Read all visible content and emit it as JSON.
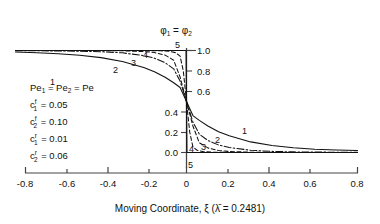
{
  "chart_data": {
    "type": "line",
    "title": "",
    "xlabel": "Moving Coordinate, ξ (λ̄ = 0.2481)",
    "ylabel": "φ₁ = φ₂",
    "xlim": [
      -0.8,
      0.8
    ],
    "ylim": [
      0.0,
      1.0
    ],
    "grid": false,
    "x_ticks": [
      "-0.8",
      "-0.6",
      "-0.4",
      "-0.2",
      "0",
      "0.2",
      "0.4",
      "0.6",
      "0.8"
    ],
    "x_tick_values": [
      -0.8,
      -0.6,
      -0.4,
      -0.2,
      0,
      0.2,
      0.4,
      0.6,
      0.8
    ],
    "y_ticks": [
      "1.0",
      "0.8",
      "0.6",
      "0.4",
      "0.2",
      "0.0"
    ],
    "y_tick_values": [
      1.0,
      0.8,
      0.6,
      0.4,
      0.2,
      0.0
    ],
    "legend_position": "inline-curve-labels",
    "series": [
      {
        "name": "1",
        "label": "1",
        "Pe": 20,
        "delta99": 2.294,
        "style": "solid",
        "x": [
          -0.8,
          -0.7,
          -0.6,
          -0.5,
          -0.4,
          -0.3,
          -0.2,
          -0.15,
          -0.1,
          -0.06,
          -0.03,
          0.0,
          0.03,
          0.06,
          0.1,
          0.15,
          0.2,
          0.3,
          0.4,
          0.5,
          0.6,
          0.7,
          0.8
        ],
        "y": [
          0.985,
          0.978,
          0.968,
          0.953,
          0.93,
          0.893,
          0.834,
          0.792,
          0.738,
          0.684,
          0.637,
          0.5,
          0.362,
          0.315,
          0.26,
          0.204,
          0.164,
          0.104,
          0.068,
          0.046,
          0.032,
          0.024,
          0.02
        ]
      },
      {
        "name": "2",
        "label": "2",
        "Pe": 40,
        "delta99": 1.147,
        "style": "dash-dot",
        "x": [
          -0.8,
          -0.7,
          -0.6,
          -0.5,
          -0.4,
          -0.3,
          -0.2,
          -0.15,
          -0.1,
          -0.06,
          -0.03,
          0.0,
          0.03,
          0.06,
          0.1,
          0.15,
          0.2,
          0.3,
          0.4,
          0.5,
          0.6,
          0.7,
          0.8
        ],
        "y": [
          0.998,
          0.997,
          0.996,
          0.993,
          0.988,
          0.977,
          0.95,
          0.925,
          0.88,
          0.82,
          0.7,
          0.5,
          0.3,
          0.18,
          0.118,
          0.074,
          0.049,
          0.022,
          0.011,
          0.006,
          0.004,
          0.003,
          0.002
        ]
      },
      {
        "name": "3",
        "label": "3",
        "Pe": 80,
        "delta99": 0.574,
        "style": "dashed",
        "x": [
          -0.8,
          -0.6,
          -0.4,
          -0.3,
          -0.2,
          -0.15,
          -0.1,
          -0.06,
          -0.03,
          0.0,
          0.03,
          0.06,
          0.1,
          0.15,
          0.2,
          0.3,
          0.4,
          0.6,
          0.8
        ],
        "y": [
          1.0,
          1.0,
          0.999,
          0.997,
          0.99,
          0.98,
          0.955,
          0.905,
          0.74,
          0.5,
          0.26,
          0.095,
          0.045,
          0.02,
          0.01,
          0.003,
          0.001,
          0.0,
          0.0
        ]
      },
      {
        "name": "4",
        "label": "4",
        "Pe": 160,
        "delta99": 0.287,
        "style": "dashed",
        "x": [
          -0.8,
          -0.4,
          -0.2,
          -0.12,
          -0.08,
          -0.05,
          -0.03,
          -0.015,
          0.0,
          0.015,
          0.03,
          0.05,
          0.08,
          0.12,
          0.2,
          0.4,
          0.8
        ],
        "y": [
          1.0,
          1.0,
          0.999,
          0.997,
          0.992,
          0.978,
          0.945,
          0.8,
          0.5,
          0.2,
          0.055,
          0.022,
          0.008,
          0.003,
          0.001,
          0.0,
          0.0
        ]
      },
      {
        "name": "5",
        "label": "5",
        "Pe": "∞",
        "delta99": 0,
        "style": "solid-step",
        "x": [
          -0.8,
          -0.002,
          0.0,
          0.002,
          0.8
        ],
        "y": [
          1.0,
          1.0,
          0.5,
          0.0,
          0.0
        ]
      }
    ]
  },
  "y_axis_label": "φ₁ = φ₂",
  "x_axis_label_parts": {
    "main": "Moving Coordinate, ξ (",
    "lambda": "λ",
    "rest": " = 0.2481)"
  },
  "legend_block": {
    "lines": [
      {
        "base": "Pe",
        "sub": "1",
        "mid": " = Pe",
        "sub2": "2",
        "tail": " = Pe",
        "sup": "",
        "value": ""
      },
      {
        "base": "c",
        "sub": "1",
        "sup": "f",
        "value": " = 0.05"
      },
      {
        "base": "c",
        "sub": "2",
        "sup": "f",
        "value": " = 0.10"
      },
      {
        "base": "c",
        "sub": "1",
        "sup": "r",
        "value": " = 0.01"
      },
      {
        "base": "c",
        "sub": "2",
        "sup": "r",
        "value": " = 0.06"
      }
    ]
  },
  "table": {
    "headers": [
      "No.",
      "Pe",
      "δ(99%)"
    ],
    "rows": [
      [
        "1",
        "20",
        "2.294"
      ],
      [
        "2",
        "40",
        "1.147"
      ],
      [
        "3",
        "80",
        "0.574"
      ],
      [
        "4",
        "160",
        "0.287"
      ],
      [
        "5",
        "∞",
        "0"
      ]
    ]
  },
  "curve_labels_upper": [
    "1",
    "2",
    "3",
    "4",
    "5"
  ],
  "curve_labels_lower": [
    "1",
    "2",
    "3",
    "4",
    "5"
  ],
  "colors": {
    "ink": "#111111",
    "axis": "#333333",
    "table_border": "#555555"
  }
}
